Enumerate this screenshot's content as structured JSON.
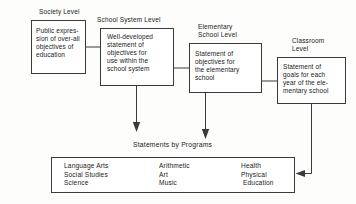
{
  "diagram": {
    "type": "flowchart",
    "title_visible": false,
    "levels": [
      {
        "id": "society",
        "caption": "Society Level",
        "body": "Public expres-\nsion of over-all\nobjectives of\neducation"
      },
      {
        "id": "school-system",
        "caption": "School System Level",
        "body": "Well-developed\nstatement of\nobjectives for\nuse within the\nschool system"
      },
      {
        "id": "elementary-school",
        "caption": "Elementary\nSchool Level",
        "body": "Statement of\nobjectives for\nthe elementary\nschool"
      },
      {
        "id": "classroom",
        "caption": "Classroom\nLevel",
        "body": "Statement of\ngoals for each\nyear of the ele-\nmentary school"
      }
    ],
    "programs": {
      "title": "Statements by Programs",
      "columns": [
        {
          "items": "Language Arts\nSocial Studies\nScience"
        },
        {
          "items": "Arithmetic\nArt\nMusic"
        },
        {
          "items": "Health\nPhysical\n Education"
        }
      ]
    },
    "colors": {
      "stroke": "#3a3a3a",
      "text": "#1a1a1a",
      "background": "#fdfdfc",
      "box_fill": "#ffffff"
    }
  }
}
